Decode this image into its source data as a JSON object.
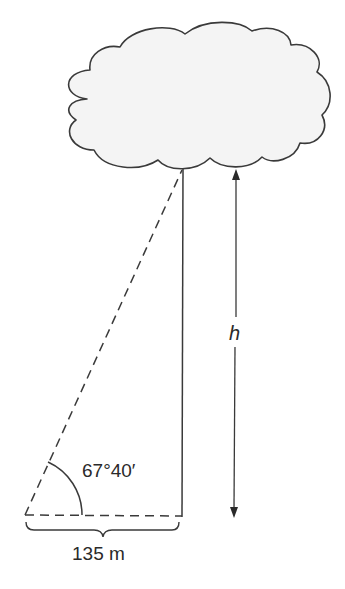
{
  "diagram": {
    "angle_label": "67°40′",
    "height_label": "h",
    "base_label": "135 m",
    "colors": {
      "stroke": "#3a3a3a",
      "cloud_fill": "#f4f4f4",
      "background": "#ffffff"
    }
  }
}
